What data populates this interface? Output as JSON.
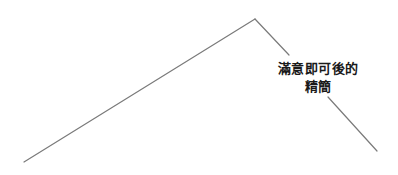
{
  "diagram": {
    "type": "line-diagram",
    "line_color": "#7a7a7a",
    "text_color": "#1a1a1a",
    "points": {
      "start": [
        24,
        162
      ],
      "peak": [
        255,
        19
      ],
      "end": [
        377,
        151
      ]
    },
    "annotation": {
      "lines": [
        "滿意即可後的",
        "精簡"
      ]
    }
  }
}
